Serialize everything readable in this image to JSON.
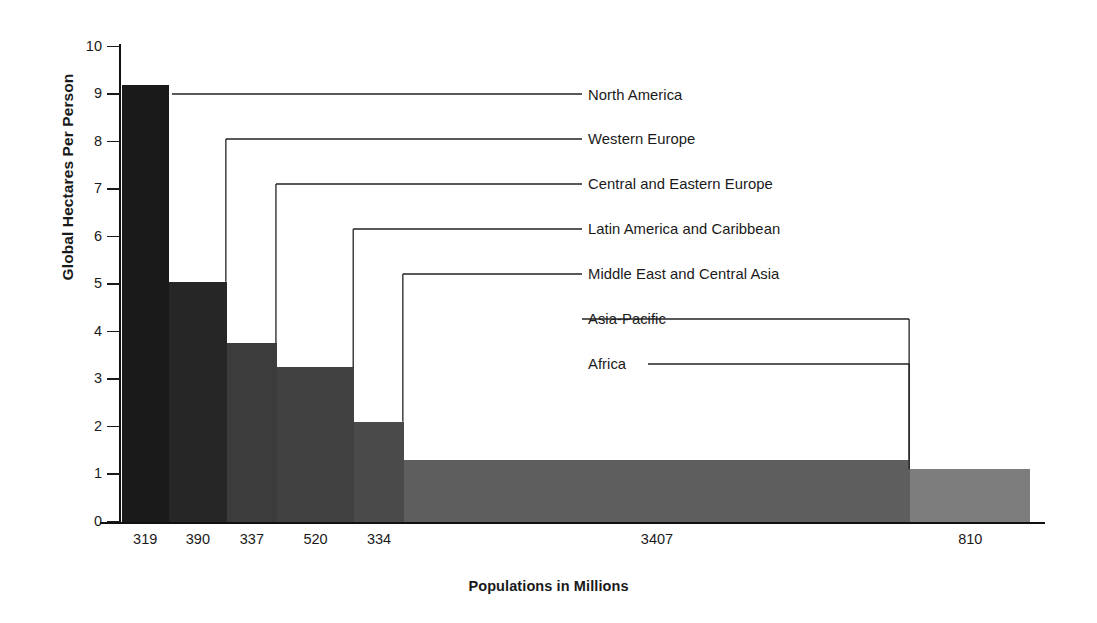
{
  "chart_data": {
    "type": "bar",
    "title": "",
    "subtitle": "",
    "xlabel": "Populations in Millions",
    "ylabel": "Global Hectares Per Person",
    "ylim": [
      0,
      10
    ],
    "yticks": [
      0,
      1,
      2,
      3,
      4,
      5,
      6,
      7,
      8,
      9,
      10
    ],
    "grid": false,
    "legend_position": "right-inline-leader-lines",
    "note": "Variable-width bar chart (Marimekko style): bar width is proportional to population, bar height is global hectares per person.",
    "categories": [
      "North America",
      "Western Europe",
      "Central and Eastern Europe",
      "Latin America and Caribbean",
      "Middle East and Central Asia",
      "Asia-Pacific",
      "Africa"
    ],
    "values": [
      9.2,
      5.05,
      3.75,
      3.25,
      2.1,
      1.3,
      1.1
    ],
    "widths": [
      319,
      390,
      337,
      520,
      334,
      3407,
      810
    ],
    "xtick_labels": [
      "319",
      "390",
      "337",
      "520",
      "334",
      "3407",
      "810"
    ],
    "colors": [
      "#1a1a1a",
      "#262626",
      "#3c3c3c",
      "#414141",
      "#4a4a4a",
      "#5e5e5e",
      "#7d7d7d"
    ],
    "series": [
      {
        "name": "Global Hectares Per Person",
        "values": [
          9.2,
          5.05,
          3.75,
          3.25,
          2.1,
          1.3,
          1.1
        ]
      }
    ],
    "points": [
      {
        "label": "North America",
        "population_millions": 319,
        "hectares_per_person": 9.2
      },
      {
        "label": "Western Europe",
        "population_millions": 390,
        "hectares_per_person": 5.05
      },
      {
        "label": "Central and Eastern Europe",
        "population_millions": 337,
        "hectares_per_person": 3.75
      },
      {
        "label": "Latin America and Caribbean",
        "population_millions": 520,
        "hectares_per_person": 3.25
      },
      {
        "label": "Middle East and Central Asia",
        "population_millions": 334,
        "hectares_per_person": 2.1
      },
      {
        "label": "Asia-Pacific",
        "population_millions": 3407,
        "hectares_per_person": 1.3
      },
      {
        "label": "Africa",
        "population_millions": 810,
        "hectares_per_person": 1.1
      }
    ]
  },
  "labels": {
    "l0": "North America",
    "l1": "Western Europe",
    "l2": "Central and Eastern Europe",
    "l3": "Latin America and Caribbean",
    "l4": "Middle East and Central Asia",
    "l5": "Asia-Pacific",
    "l6": "Africa"
  },
  "yticks": {
    "t0": "0",
    "t1": "1",
    "t2": "2",
    "t3": "3",
    "t4": "4",
    "t5": "5",
    "t6": "6",
    "t7": "7",
    "t8": "8",
    "t9": "9",
    "t10": "10"
  },
  "xticks": {
    "x0": "319",
    "x1": "390",
    "x2": "337",
    "x3": "520",
    "x4": "334",
    "x5": "3407",
    "x6": "810"
  },
  "axes": {
    "ylabel": "Global Hectares Per Person",
    "xlabel": "Populations in Millions"
  }
}
